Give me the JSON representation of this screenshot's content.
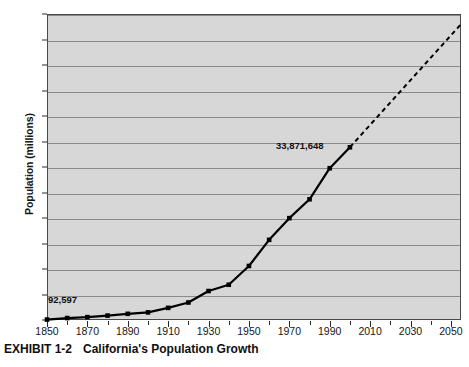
{
  "caption": {
    "label": "EXHIBIT 1-2",
    "title": "California's Population Growth"
  },
  "chart_data": {
    "type": "line",
    "title": "California's Population Growth",
    "xlabel": "",
    "ylabel": "Population (millions)",
    "xlim": [
      1850,
      2055
    ],
    "ylim": [
      0,
      60
    ],
    "grid": true,
    "legend_position": "none",
    "x_ticks": [
      1850,
      1870,
      1890,
      1910,
      1930,
      1950,
      1970,
      1990,
      2010,
      2030,
      2050
    ],
    "x_minor_tick_interval": 10,
    "y_ticks": [
      0,
      5,
      10,
      15,
      20,
      25,
      30,
      35,
      40,
      45,
      50,
      55,
      60
    ],
    "series": [
      {
        "name": "Historical population",
        "style": "solid",
        "markers": true,
        "x": [
          1850,
          1860,
          1870,
          1880,
          1890,
          1900,
          1910,
          1920,
          1930,
          1940,
          1950,
          1960,
          1970,
          1980,
          1990,
          2000
        ],
        "values": [
          0.09,
          0.38,
          0.56,
          0.86,
          1.21,
          1.49,
          2.38,
          3.43,
          5.68,
          6.91,
          10.59,
          15.72,
          19.97,
          23.67,
          29.76,
          33.87
        ]
      },
      {
        "name": "Projected population",
        "style": "dashed",
        "markers": false,
        "x": [
          2000,
          2055
        ],
        "values": [
          33.87,
          58.0
        ]
      }
    ],
    "annotations": [
      {
        "id": "annotation-1850",
        "text": "92,597",
        "x": 1850,
        "y": 0.09
      },
      {
        "id": "annotation-2000",
        "text": "33,871,648",
        "x": 2000,
        "y": 33.87
      }
    ],
    "colors": {
      "plot_background": "#d7d7d7",
      "gridline": "#8a8a8a",
      "series_line": "#000000",
      "axis": "#4a4a4a",
      "text": "#101010"
    }
  }
}
